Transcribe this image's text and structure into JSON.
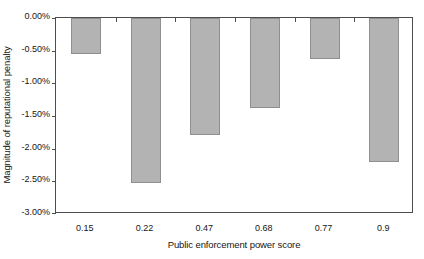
{
  "chart_data": {
    "type": "bar",
    "title": "",
    "xlabel": "Public enforcement power score",
    "ylabel": "Magnitude of reputational penalty",
    "categories": [
      "0.15",
      "0.22",
      "0.47",
      "0.68",
      "0.77",
      "0.9"
    ],
    "values": [
      -0.55,
      -2.52,
      -1.79,
      -1.37,
      -0.62,
      -2.2
    ],
    "value_labels": [
      "-0.55%",
      "-2.52%",
      "-1.79%",
      "-1.37%",
      "-0.62%",
      "-2.20%"
    ],
    "ylim": [
      -3.0,
      0.0
    ],
    "y_ticks": [
      0.0,
      -0.5,
      -1.0,
      -1.5,
      -2.0,
      -2.5,
      -3.0
    ],
    "y_tick_labels": [
      "0.00%",
      "-0.50%",
      "-1.00%",
      "-1.50%",
      "-2.00%",
      "-2.50%",
      "-3.00%"
    ],
    "grid": false,
    "legend": "none",
    "bar_fill_color": "#b3b3b3",
    "bar_edge_color": "#8f8f8f",
    "axis_color": "#4d4d4d",
    "background_color": "#ffffff",
    "series": [
      {
        "name": "Magnitude of reputational penalty",
        "values": [
          -0.55,
          -2.52,
          -1.79,
          -1.37,
          -0.62,
          -2.2
        ]
      }
    ]
  }
}
